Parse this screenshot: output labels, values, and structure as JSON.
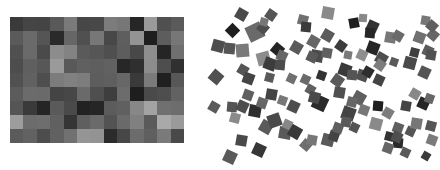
{
  "mosaic": {
    "rows": 9,
    "cols": 13,
    "cells": [
      [
        "#3a3a3a",
        "#454545",
        "#444444",
        "#595959",
        "#7a7a7a",
        "#474747",
        "#484848",
        "#7c7c7c",
        "#777777",
        "#262626",
        "#9a9a9a",
        "#505050",
        "#5a5a5a"
      ],
      [
        "#5a5a5a",
        "#6a6a6a",
        "#555555",
        "#2a2a2a",
        "#666666",
        "#505050",
        "#777777",
        "#484848",
        "#5e5e5e",
        "#939393",
        "#1e1e1e",
        "#5d5d5d",
        "#777777"
      ],
      [
        "#505050",
        "#6a6a6a",
        "#4a4a4a",
        "#8c8c8c",
        "#838383",
        "#5a5a5a",
        "#565656",
        "#4f4f4f",
        "#5d5d5d",
        "#484848",
        "#8e8e8e",
        "#252525",
        "#6f6f6f"
      ],
      [
        "#4d4d4d",
        "#5f5f5f",
        "#575757",
        "#9a9a9a",
        "#595959",
        "#606060",
        "#5e5e5e",
        "#616161",
        "#272727",
        "#2f2f2f",
        "#8c8c8c",
        "#4e4e4e",
        "#303030"
      ],
      [
        "#515151",
        "#616161",
        "#4e4e4e",
        "#7c7c7c",
        "#818181",
        "#7d7d7d",
        "#5d5d5d",
        "#5f5f5f",
        "#676767",
        "#3a3a3a",
        "#7b7b7b",
        "#202020",
        "#575757"
      ],
      [
        "#5b5b5b",
        "#6b6b6b",
        "#6a6a6a",
        "#444444",
        "#474747",
        "#6a6a6a",
        "#4f4f4f",
        "#3e3e3e",
        "#6c6c6c",
        "#1e1e1e",
        "#4a4a4a",
        "#4e4e4e",
        "#626262"
      ],
      [
        "#555555",
        "#3a3a3a",
        "#252525",
        "#5a5a5a",
        "#4a4a4a",
        "#222222",
        "#262626",
        "#5c5c5c",
        "#606060",
        "#878787",
        "#a3a3a3",
        "#707070",
        "#6d6d6d"
      ],
      [
        "#9d9d9d",
        "#6c6c6c",
        "#6e6e6e",
        "#606060",
        "#353535",
        "#5f5f5f",
        "#6a6a6a",
        "#535353",
        "#6a6a6a",
        "#808080",
        "#5a5a5a",
        "#a9a9a9",
        "#9a9a9a"
      ],
      [
        "#5b5b5b",
        "#626262",
        "#4d4d4d",
        "#616161",
        "#717171",
        "#959595",
        "#939393",
        "#2b2b2b",
        "#474747",
        "#6c6c6c",
        "#5f5f5f",
        "#7a7a7a",
        "#494949"
      ]
    ]
  },
  "scatter": {
    "squares": [
      {
        "x": 41,
        "y": 14,
        "s": 11,
        "r": 30,
        "c": "#4a4a4a"
      },
      {
        "x": 71,
        "y": 15,
        "s": 10,
        "r": 35,
        "c": "#555555"
      },
      {
        "x": 32,
        "y": 30,
        "s": 11,
        "r": 45,
        "c": "#1f1f1f"
      },
      {
        "x": 55,
        "y": 32,
        "s": 16,
        "r": -25,
        "c": "#6a6a6a"
      },
      {
        "x": 63,
        "y": 28,
        "s": 10,
        "r": 40,
        "c": "#4e4e4e"
      },
      {
        "x": 64,
        "y": 22,
        "s": 8,
        "r": 15,
        "c": "#777777"
      },
      {
        "x": 18,
        "y": 46,
        "s": 12,
        "r": 15,
        "c": "#4e4e4e"
      },
      {
        "x": 29,
        "y": 48,
        "s": 11,
        "r": 5,
        "c": "#555555"
      },
      {
        "x": 42,
        "y": 50,
        "s": 13,
        "r": -5,
        "c": "#7a7a7a"
      },
      {
        "x": 77,
        "y": 49,
        "s": 11,
        "r": 40,
        "c": "#242424"
      },
      {
        "x": 63,
        "y": 58,
        "s": 13,
        "r": -15,
        "c": "#8c8c8c"
      },
      {
        "x": 82,
        "y": 56,
        "s": 10,
        "r": 25,
        "c": "#666666"
      },
      {
        "x": 70,
        "y": 64,
        "s": 12,
        "r": 20,
        "c": "#3c3c3c"
      },
      {
        "x": 80,
        "y": 65,
        "s": 10,
        "r": 5,
        "c": "#4c4c4c"
      },
      {
        "x": 96,
        "y": 47,
        "s": 11,
        "r": 30,
        "c": "#5a5a5a"
      },
      {
        "x": 103,
        "y": 20,
        "s": 10,
        "r": 15,
        "c": "#707070"
      },
      {
        "x": 106,
        "y": 27,
        "s": 10,
        "r": 5,
        "c": "#3b3b3b"
      },
      {
        "x": 113,
        "y": 41,
        "s": 11,
        "r": 30,
        "c": "#666666"
      },
      {
        "x": 117,
        "y": 56,
        "s": 12,
        "r": 10,
        "c": "#4c4c4c"
      },
      {
        "x": 112,
        "y": 57,
        "s": 10,
        "r": 25,
        "c": "#595959"
      },
      {
        "x": 16,
        "y": 77,
        "s": 12,
        "r": 40,
        "c": "#505050"
      },
      {
        "x": 43,
        "y": 70,
        "s": 10,
        "r": 30,
        "c": "#555555"
      },
      {
        "x": 48,
        "y": 78,
        "s": 11,
        "r": 20,
        "c": "#444444"
      },
      {
        "x": 69,
        "y": 77,
        "s": 9,
        "r": 15,
        "c": "#5a5a5a"
      },
      {
        "x": 91,
        "y": 78,
        "s": 9,
        "r": 25,
        "c": "#707070"
      },
      {
        "x": 105,
        "y": 79,
        "s": 9,
        "r": 25,
        "c": "#6a6a6a"
      },
      {
        "x": 128,
        "y": 13,
        "s": 12,
        "r": 10,
        "c": "#8a8a8a"
      },
      {
        "x": 154,
        "y": 23,
        "s": 10,
        "r": -10,
        "c": "#1e1e1e"
      },
      {
        "x": 163,
        "y": 18,
        "s": 8,
        "r": 5,
        "c": "#888888"
      },
      {
        "x": 172,
        "y": 26,
        "s": 11,
        "r": 25,
        "c": "#333333"
      },
      {
        "x": 170,
        "y": 33,
        "s": 10,
        "r": 5,
        "c": "#272727"
      },
      {
        "x": 190,
        "y": 37,
        "s": 11,
        "r": 10,
        "c": "#777777"
      },
      {
        "x": 198,
        "y": 36,
        "s": 10,
        "r": 30,
        "c": "#6a6a6a"
      },
      {
        "x": 127,
        "y": 35,
        "s": 11,
        "r": 30,
        "c": "#5b5b5b"
      },
      {
        "x": 141,
        "y": 46,
        "s": 10,
        "r": 35,
        "c": "#3c3c3c"
      },
      {
        "x": 127,
        "y": 53,
        "s": 10,
        "r": 10,
        "c": "#606060"
      },
      {
        "x": 148,
        "y": 55,
        "s": 8,
        "r": 10,
        "c": "#7a7a7a"
      },
      {
        "x": 173,
        "y": 48,
        "s": 12,
        "r": 20,
        "c": "#262626"
      },
      {
        "x": 162,
        "y": 55,
        "s": 10,
        "r": 25,
        "c": "#8e8e8e"
      },
      {
        "x": 181,
        "y": 58,
        "s": 11,
        "r": 30,
        "c": "#4e4e4e"
      },
      {
        "x": 219,
        "y": 37,
        "s": 11,
        "r": 20,
        "c": "#707070"
      },
      {
        "x": 233,
        "y": 35,
        "s": 10,
        "r": 40,
        "c": "#666666"
      },
      {
        "x": 228,
        "y": 51,
        "s": 10,
        "r": 25,
        "c": "#5c5c5c"
      },
      {
        "x": 214,
        "y": 52,
        "s": 9,
        "r": 15,
        "c": "#3f3f3f"
      },
      {
        "x": 231,
        "y": 55,
        "s": 10,
        "r": 10,
        "c": "#505050"
      },
      {
        "x": 225,
        "y": 20,
        "s": 9,
        "r": 10,
        "c": "#777777"
      },
      {
        "x": 232,
        "y": 26,
        "s": 10,
        "r": 40,
        "c": "#5f5f5f"
      },
      {
        "x": 210,
        "y": 63,
        "s": 12,
        "r": 15,
        "c": "#4a4a4a"
      },
      {
        "x": 224,
        "y": 72,
        "s": 11,
        "r": 25,
        "c": "#555555"
      },
      {
        "x": 180,
        "y": 65,
        "s": 10,
        "r": 35,
        "c": "#7d7d7d"
      },
      {
        "x": 194,
        "y": 62,
        "s": 8,
        "r": 20,
        "c": "#5a5a5a"
      },
      {
        "x": 162,
        "y": 75,
        "s": 11,
        "r": 20,
        "c": "#505050"
      },
      {
        "x": 168,
        "y": 72,
        "s": 10,
        "r": 30,
        "c": "#2e2e2e"
      },
      {
        "x": 179,
        "y": 80,
        "s": 10,
        "r": 25,
        "c": "#444444"
      },
      {
        "x": 145,
        "y": 70,
        "s": 12,
        "r": 20,
        "c": "#3a3a3a"
      },
      {
        "x": 152,
        "y": 75,
        "s": 10,
        "r": 5,
        "c": "#555555"
      },
      {
        "x": 137,
        "y": 80,
        "s": 11,
        "r": 35,
        "c": "#5a5a5a"
      },
      {
        "x": 121,
        "y": 75,
        "s": 9,
        "r": 20,
        "c": "#333333"
      },
      {
        "x": 14,
        "y": 107,
        "s": 10,
        "r": 30,
        "c": "#5a5a5a"
      },
      {
        "x": 32,
        "y": 107,
        "s": 10,
        "r": 5,
        "c": "#555555"
      },
      {
        "x": 42,
        "y": 106,
        "s": 11,
        "r": 25,
        "c": "#4e4e4e"
      },
      {
        "x": 48,
        "y": 95,
        "s": 10,
        "r": 20,
        "c": "#5f5f5f"
      },
      {
        "x": 35,
        "y": 118,
        "s": 10,
        "r": 15,
        "c": "#8a8a8a"
      },
      {
        "x": 55,
        "y": 111,
        "s": 12,
        "r": 10,
        "c": "#2e2e2e"
      },
      {
        "x": 62,
        "y": 103,
        "s": 10,
        "r": 20,
        "c": "#666666"
      },
      {
        "x": 71,
        "y": 94,
        "s": 11,
        "r": 10,
        "c": "#444444"
      },
      {
        "x": 82,
        "y": 100,
        "s": 9,
        "r": 20,
        "c": "#777777"
      },
      {
        "x": 93,
        "y": 106,
        "s": 11,
        "r": 25,
        "c": "#4e4e4e"
      },
      {
        "x": 110,
        "y": 89,
        "s": 9,
        "r": 30,
        "c": "#5f5f5f"
      },
      {
        "x": 120,
        "y": 103,
        "s": 14,
        "r": 25,
        "c": "#2a2a2a"
      },
      {
        "x": 114,
        "y": 97,
        "s": 11,
        "r": 15,
        "c": "#4a4a4a"
      },
      {
        "x": 66,
        "y": 127,
        "s": 12,
        "r": 30,
        "c": "#5a5a5a"
      },
      {
        "x": 74,
        "y": 120,
        "s": 13,
        "r": -20,
        "c": "#4a4a4a"
      },
      {
        "x": 85,
        "y": 133,
        "s": 12,
        "r": 10,
        "c": "#5a5a5a"
      },
      {
        "x": 87,
        "y": 124,
        "s": 9,
        "r": 25,
        "c": "#888888"
      },
      {
        "x": 95,
        "y": 132,
        "s": 12,
        "r": 30,
        "c": "#383838"
      },
      {
        "x": 41,
        "y": 140,
        "s": 11,
        "r": 10,
        "c": "#4a4a4a"
      },
      {
        "x": 59,
        "y": 150,
        "s": 12,
        "r": 25,
        "c": "#373737"
      },
      {
        "x": 30,
        "y": 157,
        "s": 12,
        "r": 25,
        "c": "#5a5a5a"
      },
      {
        "x": 106,
        "y": 145,
        "s": 10,
        "r": 40,
        "c": "#6e6e6e"
      },
      {
        "x": 128,
        "y": 140,
        "s": 12,
        "r": 15,
        "c": "#5a5a5a"
      },
      {
        "x": 134,
        "y": 136,
        "s": 10,
        "r": 20,
        "c": "#444444"
      },
      {
        "x": 138,
        "y": 128,
        "s": 10,
        "r": 20,
        "c": "#5f5f5f"
      },
      {
        "x": 112,
        "y": 140,
        "s": 10,
        "r": 10,
        "c": "#777777"
      },
      {
        "x": 159,
        "y": 98,
        "s": 12,
        "r": 30,
        "c": "#5f5f5f"
      },
      {
        "x": 164,
        "y": 110,
        "s": 10,
        "r": 20,
        "c": "#777777"
      },
      {
        "x": 178,
        "y": 106,
        "s": 10,
        "r": 5,
        "c": "#1e1e1e"
      },
      {
        "x": 148,
        "y": 113,
        "s": 13,
        "r": 20,
        "c": "#444444"
      },
      {
        "x": 146,
        "y": 122,
        "s": 10,
        "r": 10,
        "c": "#5a5a5a"
      },
      {
        "x": 154,
        "y": 127,
        "s": 9,
        "r": 25,
        "c": "#555555"
      },
      {
        "x": 152,
        "y": 102,
        "s": 10,
        "r": 15,
        "c": "#666666"
      },
      {
        "x": 139,
        "y": 92,
        "s": 11,
        "r": 10,
        "c": "#505050"
      },
      {
        "x": 176,
        "y": 124,
        "s": 12,
        "r": 15,
        "c": "#8a8a8a"
      },
      {
        "x": 198,
        "y": 143,
        "s": 10,
        "r": 5,
        "c": "#2a2a2a"
      },
      {
        "x": 188,
        "y": 148,
        "s": 10,
        "r": 20,
        "c": "#666666"
      },
      {
        "x": 198,
        "y": 128,
        "s": 10,
        "r": 20,
        "c": "#5f5f5f"
      },
      {
        "x": 210,
        "y": 131,
        "s": 9,
        "r": 25,
        "c": "#555555"
      },
      {
        "x": 206,
        "y": 106,
        "s": 10,
        "r": 10,
        "c": "#444444"
      },
      {
        "x": 223,
        "y": 103,
        "s": 11,
        "r": 25,
        "c": "#262626"
      },
      {
        "x": 215,
        "y": 94,
        "s": 10,
        "r": 30,
        "c": "#888888"
      },
      {
        "x": 229,
        "y": 98,
        "s": 9,
        "r": 20,
        "c": "#666666"
      },
      {
        "x": 189,
        "y": 136,
        "s": 9,
        "r": 15,
        "c": "#333333"
      },
      {
        "x": 197,
        "y": 137,
        "s": 10,
        "r": 25,
        "c": "#4e4e4e"
      },
      {
        "x": 216,
        "y": 123,
        "s": 11,
        "r": 10,
        "c": "#777777"
      },
      {
        "x": 231,
        "y": 126,
        "s": 10,
        "r": 15,
        "c": "#555555"
      },
      {
        "x": 232,
        "y": 140,
        "s": 10,
        "r": 20,
        "c": "#7a7a7a"
      },
      {
        "x": 188,
        "y": 113,
        "s": 10,
        "r": 30,
        "c": "#7d7d7d"
      },
      {
        "x": 205,
        "y": 152,
        "s": 9,
        "r": 25,
        "c": "#5a5a5a"
      },
      {
        "x": 226,
        "y": 156,
        "s": 8,
        "r": 30,
        "c": "#3a3a3a"
      }
    ]
  }
}
